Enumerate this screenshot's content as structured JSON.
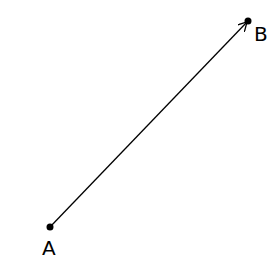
{
  "diagram": {
    "points": [
      {
        "label": "A",
        "x": 50,
        "y": 227
      },
      {
        "label": "B",
        "x": 248,
        "y": 21
      }
    ],
    "vector": {
      "from": "A",
      "to": "B",
      "arrowhead": "B"
    },
    "colors": {
      "line": "#000000",
      "point": "#000000",
      "background": "#ffffff"
    }
  }
}
